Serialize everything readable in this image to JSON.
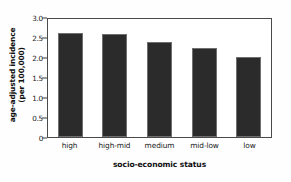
{
  "chart_data": {
    "type": "bar",
    "title": "",
    "subtitle": "",
    "xlabel": "socio-economic status",
    "ylabel_line1": "age-adjusted incidence",
    "ylabel_line2": "(per 100,000)",
    "categories": [
      "high",
      "high-mid",
      "medium",
      "mid-low",
      "low"
    ],
    "values": [
      2.6,
      2.57,
      2.37,
      2.22,
      2.0
    ],
    "ylim": [
      0,
      3.0
    ],
    "yticks": [
      "0",
      "0.5",
      "1.0",
      "1.5",
      "2.0",
      "2.5",
      "3.0"
    ],
    "ytick_values": [
      0,
      0.5,
      1.0,
      1.5,
      2.0,
      2.5,
      3.0
    ],
    "grid": false,
    "legend": "none",
    "bar_color": "#2b2b2b",
    "frame_color": "#4a4a4a",
    "background": "#ffffff"
  }
}
